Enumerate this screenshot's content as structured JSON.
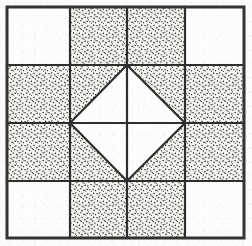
{
  "figure": {
    "width": 252,
    "height": 246
  },
  "colors": {
    "background": "#fbfbf9",
    "plain_patch": "#fdfdfb",
    "shaded_patch_base": "#f2f2ee",
    "stipple_dot": "#2b2b2b",
    "line": "#2e2e2e",
    "outer_border": "#333333"
  },
  "geometry": {
    "border_left": 7,
    "border_top": 7,
    "border_right": 244,
    "border_bottom": 238,
    "grid_x": [
      7,
      70,
      127,
      185,
      244
    ],
    "grid_y": [
      7,
      65,
      123,
      181,
      238
    ],
    "diamond_vertices": "127,65 185,123 127,181 70,123",
    "outer_border_width": 3,
    "grid_line_width": 2.2,
    "diamond_line_width": 2.2
  },
  "grid": {
    "rows": 4,
    "columns": 4,
    "cells": [
      [
        {
          "name": "r1c1",
          "fill": "plain"
        },
        {
          "name": "r1c2",
          "fill": "stipple"
        },
        {
          "name": "r1c3",
          "fill": "stipple"
        },
        {
          "name": "r1c4",
          "fill": "plain"
        }
      ],
      [
        {
          "name": "r2c1",
          "fill": "stipple"
        },
        {
          "name": "r2c2",
          "fill": "half-stipple-corner-nw"
        },
        {
          "name": "r2c3",
          "fill": "half-stipple-corner-ne"
        },
        {
          "name": "r2c4",
          "fill": "stipple"
        }
      ],
      [
        {
          "name": "r3c1",
          "fill": "stipple"
        },
        {
          "name": "r3c2",
          "fill": "half-stipple-corner-sw"
        },
        {
          "name": "r3c3",
          "fill": "half-stipple-corner-se"
        },
        {
          "name": "r3c4",
          "fill": "stipple"
        }
      ],
      [
        {
          "name": "r4c1",
          "fill": "plain"
        },
        {
          "name": "r4c2",
          "fill": "stipple"
        },
        {
          "name": "r4c3",
          "fill": "stipple"
        },
        {
          "name": "r4c4",
          "fill": "plain"
        }
      ]
    ]
  },
  "center_motif": {
    "name": "square-in-square diamond",
    "fill": "plain",
    "corner_triangles": 4,
    "corner_triangle_fill": "stipple",
    "divided_by": "center cross of grid lines"
  }
}
